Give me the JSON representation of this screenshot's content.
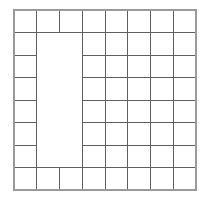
{
  "figure": {
    "background_color": "#ffffff",
    "line_color": "#5f5f5f",
    "outline_color": "#9a9a9a",
    "line_width": 1,
    "outline_width": 2
  },
  "grid": {
    "columns": 8,
    "rows": 8,
    "origin_x": 14,
    "origin_y": 10,
    "cell_width": 22.75,
    "cell_height": 22.5,
    "total_width": 182,
    "total_height": 180,
    "column_edges": [
      14,
      36.75,
      59.5,
      82.25,
      105,
      127.75,
      150.5,
      173.25,
      196
    ],
    "row_edges": [
      10,
      32.5,
      55,
      77.5,
      100,
      122.5,
      145,
      167.5,
      190
    ]
  },
  "notch": {
    "label": "undivided-block",
    "start_column": 2,
    "end_column": 3,
    "start_row": 2,
    "end_row": 7,
    "x": 36.75,
    "y": 32.5,
    "width": 45.5,
    "height": 135,
    "fill": "#ffffff"
  },
  "segments": {
    "horizontal": [
      {
        "name": "h-row0-full",
        "y": 10,
        "x1": 14,
        "x2": 196
      },
      {
        "name": "h-row1-full",
        "y": 32.5,
        "x1": 14,
        "x2": 196
      },
      {
        "name": "h-row2-left",
        "y": 55,
        "x1": 14,
        "x2": 36.75
      },
      {
        "name": "h-row2-right",
        "y": 55,
        "x1": 82.25,
        "x2": 196
      },
      {
        "name": "h-row3-left",
        "y": 77.5,
        "x1": 14,
        "x2": 36.75
      },
      {
        "name": "h-row3-right",
        "y": 77.5,
        "x1": 82.25,
        "x2": 196
      },
      {
        "name": "h-row4-left",
        "y": 100,
        "x1": 14,
        "x2": 36.75
      },
      {
        "name": "h-row4-right",
        "y": 100,
        "x1": 82.25,
        "x2": 196
      },
      {
        "name": "h-row5-left",
        "y": 122.5,
        "x1": 14,
        "x2": 36.75
      },
      {
        "name": "h-row5-right",
        "y": 122.5,
        "x1": 82.25,
        "x2": 196
      },
      {
        "name": "h-row6-left",
        "y": 145,
        "x1": 14,
        "x2": 36.75
      },
      {
        "name": "h-row6-right",
        "y": 145,
        "x1": 82.25,
        "x2": 196
      },
      {
        "name": "h-row7-full",
        "y": 167.5,
        "x1": 14,
        "x2": 196
      },
      {
        "name": "h-row8-full",
        "y": 190,
        "x1": 14,
        "x2": 196
      }
    ],
    "vertical": [
      {
        "name": "v-col0-full",
        "x": 14,
        "y1": 10,
        "y2": 190
      },
      {
        "name": "v-col1-full",
        "x": 36.75,
        "y1": 10,
        "y2": 190
      },
      {
        "name": "v-col2-top",
        "x": 59.5,
        "y1": 10,
        "y2": 32.5
      },
      {
        "name": "v-col2-bottom",
        "x": 59.5,
        "y1": 167.5,
        "y2": 190
      },
      {
        "name": "v-col3-full",
        "x": 82.25,
        "y1": 10,
        "y2": 190
      },
      {
        "name": "v-col4-full",
        "x": 105,
        "y1": 10,
        "y2": 190
      },
      {
        "name": "v-col5-full",
        "x": 127.75,
        "y1": 10,
        "y2": 190
      },
      {
        "name": "v-col6-full",
        "x": 150.5,
        "y1": 10,
        "y2": 190
      },
      {
        "name": "v-col7-full",
        "x": 173.25,
        "y1": 10,
        "y2": 190
      },
      {
        "name": "v-col8-full",
        "x": 196,
        "y1": 10,
        "y2": 190
      }
    ]
  },
  "outline": {
    "name": "grid-outer-border",
    "x": 14,
    "y": 10,
    "width": 182,
    "height": 180
  }
}
